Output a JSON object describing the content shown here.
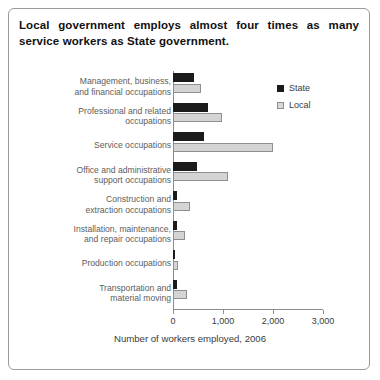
{
  "title": {
    "line1": "Local government employs almost four times as many",
    "line2": "service workers as State government."
  },
  "legend": {
    "position": "top-right",
    "items": [
      {
        "label": "State",
        "color": "#1b1b1b"
      },
      {
        "label": "Local",
        "color": "#d8d8d8"
      }
    ]
  },
  "axis": {
    "xlabel": "Number of workers employed, 2006",
    "ticks": [
      "0",
      "1,000",
      "2,000",
      "3,000"
    ]
  },
  "chart_data": {
    "type": "bar",
    "orientation": "horizontal",
    "title": "Local government employs almost four times as many service workers as State government.",
    "xlabel": "Number of workers employed, 2006",
    "ylabel": "",
    "xlim": [
      0,
      3000
    ],
    "xticks": [
      0,
      1000,
      2000,
      3000
    ],
    "grid": false,
    "legend_position": "top-right",
    "categories": [
      "Management, business, and financial occupations",
      "Professional and related occupations",
      "Service occupations",
      "Office and administrative support occupations",
      "Construction and extraction occupations",
      "Installation, maintenance, and repair occupations",
      "Production occupations",
      "Transportation and material moving"
    ],
    "category_lines": [
      [
        "Management, business,",
        "and financial occupations"
      ],
      [
        "Professional and related",
        "occupations"
      ],
      [
        "Service occupations"
      ],
      [
        "Office and administrative",
        "support occupations"
      ],
      [
        "Construction and",
        "extraction occupations"
      ],
      [
        "Installation, maintenance,",
        "and repair occupations"
      ],
      [
        "Production occupations"
      ],
      [
        "Transportation and",
        "material moving"
      ]
    ],
    "series": [
      {
        "name": "State",
        "color": "#1b1b1b",
        "values": [
          420,
          700,
          620,
          480,
          80,
          70,
          30,
          70
        ]
      },
      {
        "name": "Local",
        "color": "#d8d8d8",
        "values": [
          560,
          980,
          2000,
          1100,
          340,
          240,
          90,
          270
        ]
      }
    ]
  }
}
